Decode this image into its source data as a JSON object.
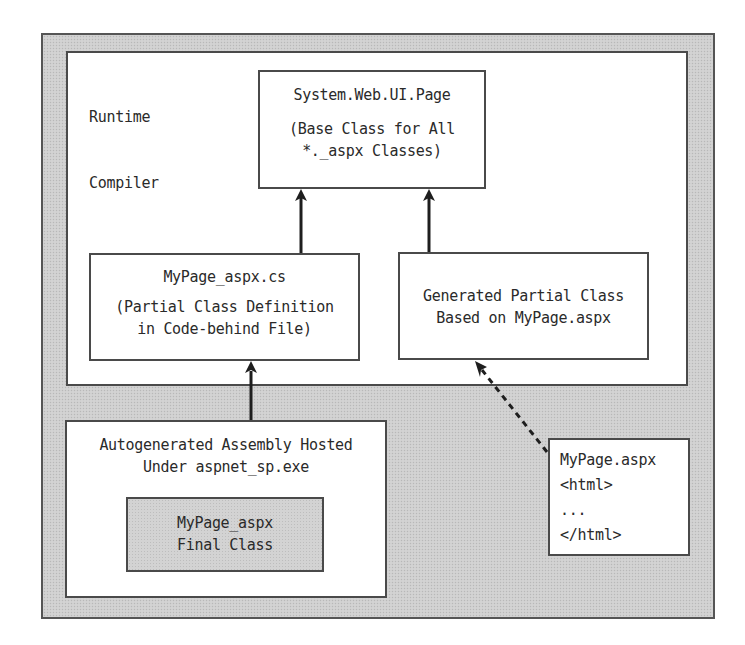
{
  "diagram": {
    "runtime_compiler_label": [
      "Runtime",
      "Compiler"
    ],
    "base_class_box": {
      "title": "System.Web.UI.Page",
      "subtitle_lines": [
        "(Base Class for All",
        "*._aspx Classes)"
      ]
    },
    "codebehind_box": {
      "title": "MyPage_aspx.cs",
      "subtitle_lines": [
        "(Partial Class Definition",
        "in Code-behind File)"
      ]
    },
    "generated_box": {
      "lines": [
        "Generated Partial Class",
        "Based on MyPage.aspx"
      ]
    },
    "assembly_box": {
      "lines": [
        "Autogenerated Assembly Hosted",
        "Under aspnet_sp.exe"
      ]
    },
    "final_class_box": {
      "lines": [
        "MyPage_aspx",
        "Final Class"
      ]
    },
    "aspx_file_box": {
      "lines": [
        "MyPage.aspx",
        "<html>",
        "...",
        "</html>"
      ]
    },
    "connections": [
      {
        "from": "codebehind_box",
        "to": "base_class_box",
        "style": "solid"
      },
      {
        "from": "generated_box",
        "to": "base_class_box",
        "style": "solid"
      },
      {
        "from": "assembly_box",
        "to": "codebehind_box",
        "style": "solid"
      },
      {
        "from": "aspx_file_box",
        "to": "generated_box",
        "style": "dashed"
      }
    ]
  },
  "colors": {
    "frame_gray": "#cfcfcf",
    "border": "#4a4a4a",
    "text": "#2a2a2a",
    "background": "#ffffff"
  }
}
